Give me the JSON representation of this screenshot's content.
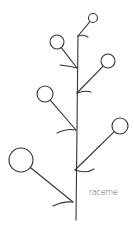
{
  "diagram": {
    "label": {
      "text": "raceme",
      "x": 89,
      "y": 188
    },
    "colors": {
      "stroke": "#333333",
      "label": "#555555",
      "background": "#ffffff"
    },
    "stem": {
      "x1": 78,
      "y1": 36,
      "x2": 76,
      "y2": 220
    },
    "flowers": [
      {
        "id": "flower-1",
        "side": "right",
        "cx": 93,
        "cy": 18,
        "r": 4.5,
        "node": [
          78,
          36
        ],
        "bract": "M78,36 Q84,34 88,37"
      },
      {
        "id": "flower-2",
        "side": "left",
        "cx": 57,
        "cy": 42,
        "r": 7,
        "node": [
          77,
          68
        ],
        "bract": "M60,65 Q70,66 77,68"
      },
      {
        "id": "flower-3",
        "side": "right",
        "cx": 108,
        "cy": 61,
        "r": 7,
        "node": [
          77,
          93
        ],
        "bract": "M77,93 Q85,90 91,92"
      },
      {
        "id": "flower-4",
        "side": "left",
        "cx": 45,
        "cy": 94,
        "r": 8,
        "node": [
          76,
          130
        ],
        "bract": "M57,133 Q67,128 76,130"
      },
      {
        "id": "flower-5",
        "side": "right",
        "cx": 120,
        "cy": 126,
        "r": 8,
        "node": [
          75,
          170
        ],
        "bract": "M75,170 Q86,174 94,169"
      },
      {
        "id": "flower-6",
        "side": "left",
        "cx": 21,
        "cy": 160,
        "r": 12,
        "node": [
          73,
          202
        ],
        "bract": "M53,206 Q63,201 73,202"
      }
    ]
  }
}
